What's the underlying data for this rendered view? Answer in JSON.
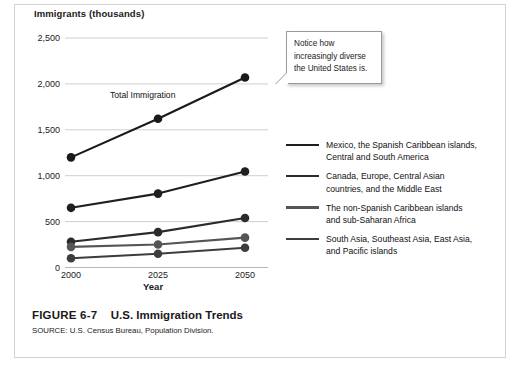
{
  "figure": {
    "number": "FIGURE 6-7",
    "title": "U.S. Immigration Trends",
    "source": "SOURCE: U.S. Census Bureau, Population Division."
  },
  "callout": {
    "line1": "Notice how",
    "line2": "increasingly diverse",
    "line3": "the United States is."
  },
  "plot_annotation": {
    "total_label": "Total Immigration"
  },
  "legend": {
    "items": [
      {
        "line1": "Mexico, the Spanish Caribbean islands,",
        "line2": "Central and South America",
        "color": "#1f1f1f"
      },
      {
        "line1": "Canada, Europe, Central Asian",
        "line2": "countries, and the Middle East",
        "color": "#2b2b2b"
      },
      {
        "line1": "The non-Spanish Caribbean islands",
        "line2": "and sub-Saharan Africa",
        "color": "#555555"
      },
      {
        "line1": "South Asia, Southeast Asia, East Asia,",
        "line2": "and Pacific islands",
        "color": "#3d3d3d"
      }
    ]
  },
  "chart_data": {
    "type": "line",
    "title": "U.S. Immigration Trends",
    "xlabel": "Year",
    "ylabel": "Immigrants  (thousands)",
    "x": [
      "2000",
      "2025",
      "2050"
    ],
    "xlim": [
      2000,
      2050
    ],
    "ylim": [
      0,
      2500
    ],
    "yticks": [
      0,
      500,
      1000,
      1500,
      2000,
      2500
    ],
    "ytick_labels": [
      "0",
      "500",
      "1,000",
      "1,500",
      "2,000",
      "2,500"
    ],
    "grid": true,
    "legend_position": "right",
    "series": [
      {
        "name": "Total Immigration",
        "values": [
          1200,
          1620,
          2070
        ],
        "color": "#1a1a1a",
        "labeled_on_plot": true
      },
      {
        "name": "Mexico, the Spanish Caribbean islands, Central and South America",
        "values": [
          650,
          805,
          1045
        ],
        "color": "#1f1f1f"
      },
      {
        "name": "Canada, Europe, Central Asian countries, and the Middle East",
        "values": [
          280,
          385,
          540
        ],
        "color": "#2b2b2b"
      },
      {
        "name": "The non-Spanish Caribbean islands and sub-Saharan Africa",
        "values": [
          225,
          250,
          325
        ],
        "color": "#555555"
      },
      {
        "name": "South Asia, Southeast Asia, East Asia, and Pacific islands",
        "values": [
          100,
          150,
          215
        ],
        "color": "#3d3d3d"
      }
    ]
  }
}
